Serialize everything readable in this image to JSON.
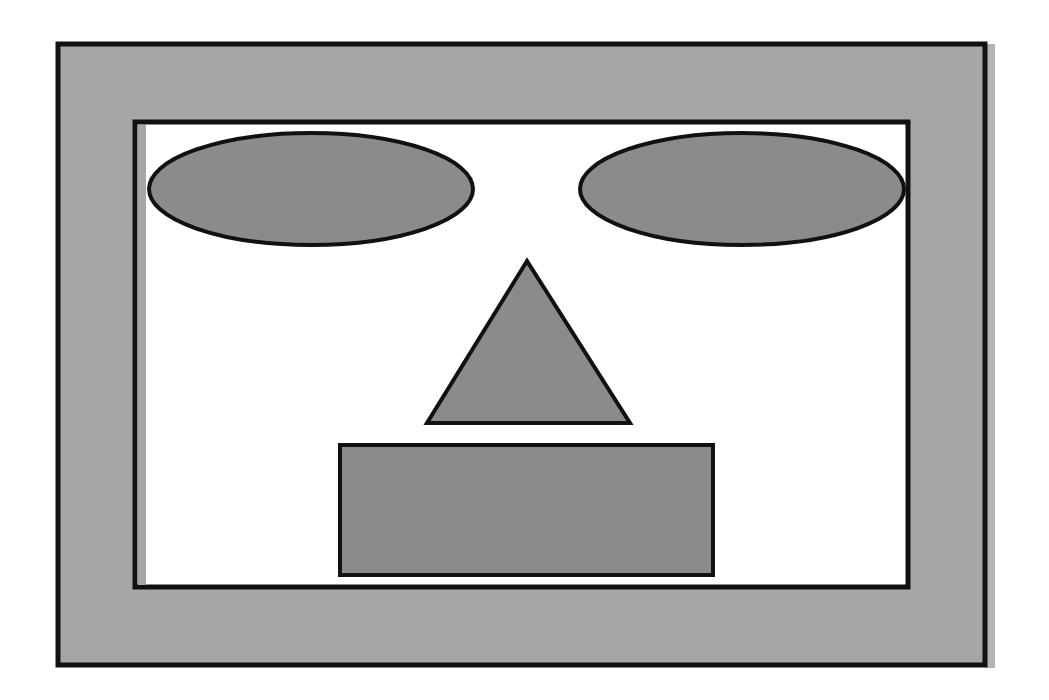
{
  "diagram": {
    "colors": {
      "background": "#ffffff",
      "frame_fill": "#a6a6a6",
      "shape_fill": "#8b8b8b",
      "inner_fill": "#ffffff",
      "stroke": "#111111",
      "shadow": "#b4b4b4"
    },
    "shapes": [
      {
        "id": "outer-frame",
        "kind": "rect",
        "role": "frame"
      },
      {
        "id": "inner-panel",
        "kind": "rect",
        "role": "panel"
      },
      {
        "id": "left-eye",
        "kind": "ellipse",
        "role": "eye"
      },
      {
        "id": "right-eye",
        "kind": "ellipse",
        "role": "eye"
      },
      {
        "id": "nose",
        "kind": "triangle",
        "role": "nose"
      },
      {
        "id": "mouth",
        "kind": "rect",
        "role": "mouth"
      }
    ]
  }
}
